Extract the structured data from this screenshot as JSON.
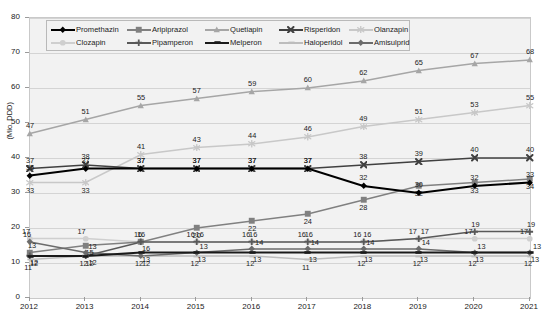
{
  "chart_data": {
    "type": "line",
    "title": "",
    "subtitle": "",
    "xlabel": "",
    "ylabel": "(Mio. DDD)",
    "categories": [
      "2012",
      "2013",
      "2014",
      "2015",
      "2016",
      "2017",
      "2018",
      "2019",
      "2020",
      "2021"
    ],
    "x": [
      2012,
      2013,
      2014,
      2015,
      2016,
      2017,
      2018,
      2019,
      2020,
      2021
    ],
    "ylim": [
      0,
      80
    ],
    "yticks": [
      0,
      10,
      20,
      30,
      40,
      50,
      60,
      70,
      80
    ],
    "grid": true,
    "legend_position": "top-inside",
    "series": [
      {
        "name": "Promethazin",
        "marker": "diamond",
        "color": "#000000",
        "values": [
          35,
          37,
          37,
          37,
          37,
          37,
          32,
          30,
          32,
          33
        ],
        "labels": [
          "35",
          "37",
          "37",
          "37",
          "37",
          "37",
          "32",
          "30",
          "32",
          "33"
        ]
      },
      {
        "name": "Aripiprazol",
        "marker": "square",
        "color": "#808080",
        "values": [
          13,
          15,
          16,
          20,
          22,
          24,
          28,
          32,
          33,
          34
        ],
        "labels": [
          "13",
          "15",
          "16",
          "20",
          "22",
          "24",
          "28",
          "32",
          "33",
          "34"
        ]
      },
      {
        "name": "Quetiapin",
        "marker": "triangle",
        "color": "#a6a6a6",
        "values": [
          47,
          51,
          55,
          57,
          59,
          60,
          62,
          65,
          67,
          68
        ],
        "labels": [
          "47",
          "51",
          "55",
          "57",
          "59",
          "60",
          "62",
          "65",
          "67",
          "68"
        ]
      },
      {
        "name": "Risperidon",
        "marker": "cross-x",
        "color": "#404040",
        "values": [
          37,
          38,
          37,
          37,
          37,
          37,
          38,
          39,
          40,
          40
        ],
        "labels": [
          "37",
          "38",
          "37",
          "37",
          "37",
          "37",
          "38",
          "39",
          "40",
          "40"
        ]
      },
      {
        "name": "Olanzapin",
        "marker": "asterisk",
        "color": "#c8c8c8",
        "values": [
          33,
          33,
          41,
          43,
          44,
          46,
          49,
          51,
          53,
          55
        ],
        "labels": [
          "33",
          "33",
          "41",
          "43",
          "44",
          "46",
          "49",
          "51",
          "53",
          "55"
        ]
      },
      {
        "name": "Clozapin",
        "marker": "circle",
        "color": "#cfcfcf",
        "values": [
          17,
          17,
          16,
          16,
          16,
          16,
          16,
          17,
          17,
          17
        ],
        "labels": [
          "17",
          "17",
          "16",
          "16",
          "16",
          "16",
          "16",
          "17",
          "17",
          "17"
        ]
      },
      {
        "name": "Pipamperon",
        "marker": "plus",
        "color": "#595959",
        "values": [
          12,
          12,
          16,
          16,
          16,
          16,
          16,
          17,
          19,
          19
        ],
        "labels": [
          "12",
          "12",
          "16",
          "16",
          "16",
          "16",
          "16",
          "17",
          "19",
          "19"
        ]
      },
      {
        "name": "Melperon",
        "marker": "bar",
        "color": "#1a1a1a",
        "values": [
          12,
          12,
          13,
          13,
          13,
          13,
          13,
          13,
          13,
          13
        ],
        "labels": [
          "12",
          "12",
          "13",
          "13",
          "13",
          "13",
          "13",
          "13",
          "13",
          "13"
        ]
      },
      {
        "name": "Haloperidol",
        "marker": "dash",
        "color": "#bdbdbd",
        "values": [
          11,
          12,
          12,
          12,
          12,
          11,
          12,
          12,
          12,
          12
        ],
        "labels": [
          "11",
          "12",
          "12",
          "12",
          "12",
          "11",
          "12",
          "12",
          "12",
          "12"
        ]
      },
      {
        "name": "Amisulprid",
        "marker": "diamond",
        "color": "#6b6b6b",
        "values": [
          16,
          13,
          12,
          13,
          14,
          14,
          14,
          14,
          13,
          13
        ],
        "labels": [
          "16",
          "13",
          "12",
          "13",
          "14",
          "14",
          "14",
          "14",
          "13",
          "13"
        ]
      }
    ]
  },
  "legend": {
    "rows": [
      [
        "Promethazin",
        "Aripiprazol",
        "Quetiapin",
        "Risperidon",
        "Olanzapin"
      ],
      [
        "Clozapin",
        "Pipamperon",
        "Melperon",
        "Haloperidol",
        "Amisulprid"
      ]
    ]
  }
}
